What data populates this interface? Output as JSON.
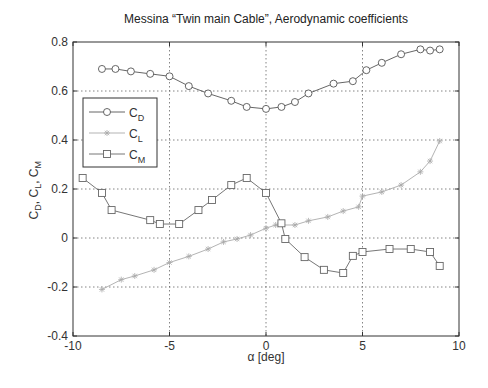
{
  "chart_data": {
    "type": "line",
    "title": "Messina “Twin main Cable”, Aerodynamic coefficients",
    "xlabel": "α [deg]",
    "ylabel": "C_D, C_L, C_M",
    "xlim": [
      -10,
      10
    ],
    "ylim": [
      -0.4,
      0.8
    ],
    "xticks": [
      -10,
      -5,
      0,
      5,
      10
    ],
    "yticks": [
      -0.4,
      -0.2,
      0,
      0.2,
      0.4,
      0.6,
      0.8
    ],
    "grid": true,
    "legend_position": "upper-left",
    "series": [
      {
        "name": "C_D",
        "marker": "circle",
        "color": "#555555",
        "x": [
          -8.5,
          -7.8,
          -7.0,
          -6.0,
          -5.0,
          -4.0,
          -3.0,
          -1.8,
          -1.0,
          0.0,
          0.8,
          1.5,
          2.2,
          3.5,
          4.5,
          5.2,
          6.0,
          7.0,
          8.0,
          8.5,
          9.0
        ],
        "y": [
          0.69,
          0.69,
          0.68,
          0.67,
          0.66,
          0.62,
          0.59,
          0.56,
          0.535,
          0.527,
          0.535,
          0.555,
          0.59,
          0.63,
          0.64,
          0.685,
          0.715,
          0.75,
          0.77,
          0.765,
          0.77
        ]
      },
      {
        "name": "C_L",
        "marker": "star",
        "color": "#aaaaaa",
        "x": [
          -8.5,
          -7.5,
          -6.8,
          -5.8,
          -5.0,
          -4.0,
          -3.0,
          -2.2,
          -1.5,
          -0.8,
          0.0,
          0.5,
          1.5,
          2.2,
          3.2,
          4.0,
          4.8,
          5.0,
          6.0,
          7.0,
          8.0,
          8.5,
          9.0
        ],
        "y": [
          -0.21,
          -0.17,
          -0.155,
          -0.13,
          -0.1,
          -0.075,
          -0.045,
          -0.016,
          -0.004,
          0.012,
          0.04,
          0.053,
          0.053,
          0.07,
          0.086,
          0.11,
          0.127,
          0.171,
          0.188,
          0.216,
          0.27,
          0.314,
          0.396
        ]
      },
      {
        "name": "C_M",
        "marker": "square",
        "color": "#666666",
        "x": [
          -9.5,
          -8.5,
          -8.0,
          -6.0,
          -5.5,
          -4.5,
          -3.5,
          -2.8,
          -1.8,
          -1.0,
          0.0,
          0.8,
          1.0,
          2.0,
          3.0,
          4.0,
          4.5,
          5.0,
          6.4,
          7.5,
          8.5,
          9.0
        ],
        "y": [
          0.245,
          0.184,
          0.114,
          0.073,
          0.057,
          0.057,
          0.114,
          0.155,
          0.216,
          0.245,
          0.184,
          0.06,
          -0.004,
          -0.078,
          -0.13,
          -0.143,
          -0.073,
          -0.057,
          -0.045,
          -0.045,
          -0.057,
          -0.114
        ]
      }
    ]
  },
  "legend": {
    "items": [
      {
        "main": "C",
        "sub": "D"
      },
      {
        "main": "C",
        "sub": "L"
      },
      {
        "main": "C",
        "sub": "M"
      }
    ]
  },
  "labels": {
    "ylabel_parts": [
      {
        "main": "C",
        "sub": "D",
        "sep": ", "
      },
      {
        "main": "C",
        "sub": "L",
        "sep": ", "
      },
      {
        "main": "C",
        "sub": "M",
        "sep": ""
      }
    ]
  }
}
